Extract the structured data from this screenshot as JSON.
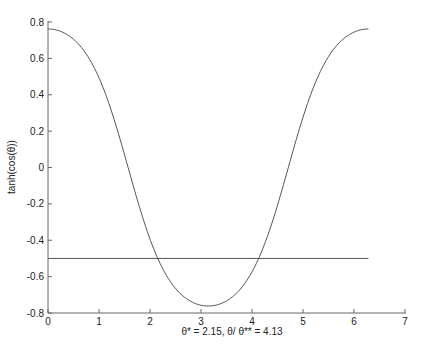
{
  "chart_data": {
    "type": "line",
    "title": "",
    "xlabel": "θ* = 2.15, θ/ θ** = 4.13",
    "ylabel": "tanh(cos(θ))",
    "xlim": [
      0,
      7
    ],
    "ylim": [
      -0.8,
      0.8
    ],
    "x_ticks": [
      "0",
      "1",
      "2",
      "3",
      "4",
      "5",
      "6",
      "7"
    ],
    "y_ticks": [
      "0.8",
      "0.6",
      "0.4",
      "0.2",
      "0",
      "-0.2",
      "-0.4",
      "-0.6",
      "-0.8"
    ],
    "grid": false,
    "legend": null,
    "series": [
      {
        "name": "tanh(cos(θ))",
        "function": "tanh(cos(x))",
        "x_range": [
          0,
          6.2832
        ],
        "x": [
          0,
          0.5,
          1.0,
          1.5,
          2.0,
          2.15,
          2.5,
          3.0,
          3.1416,
          3.5,
          4.0,
          4.13,
          4.5,
          5.0,
          5.5,
          6.0,
          6.2832
        ],
        "values": [
          0.7616,
          0.7048,
          0.4934,
          0.0707,
          -0.3936,
          -0.5,
          -0.6739,
          -0.7563,
          -0.7616,
          -0.7365,
          -0.5713,
          -0.5,
          -0.2088,
          0.2787,
          0.6271,
          0.7446,
          0.7616
        ],
        "color": "#555555"
      },
      {
        "name": "y = -0.5",
        "x": [
          0,
          6.2832
        ],
        "values": [
          -0.5,
          -0.5
        ],
        "color": "#555555"
      }
    ],
    "annotations": [
      "θ* = 2.15",
      "θ** = 4.13"
    ]
  }
}
